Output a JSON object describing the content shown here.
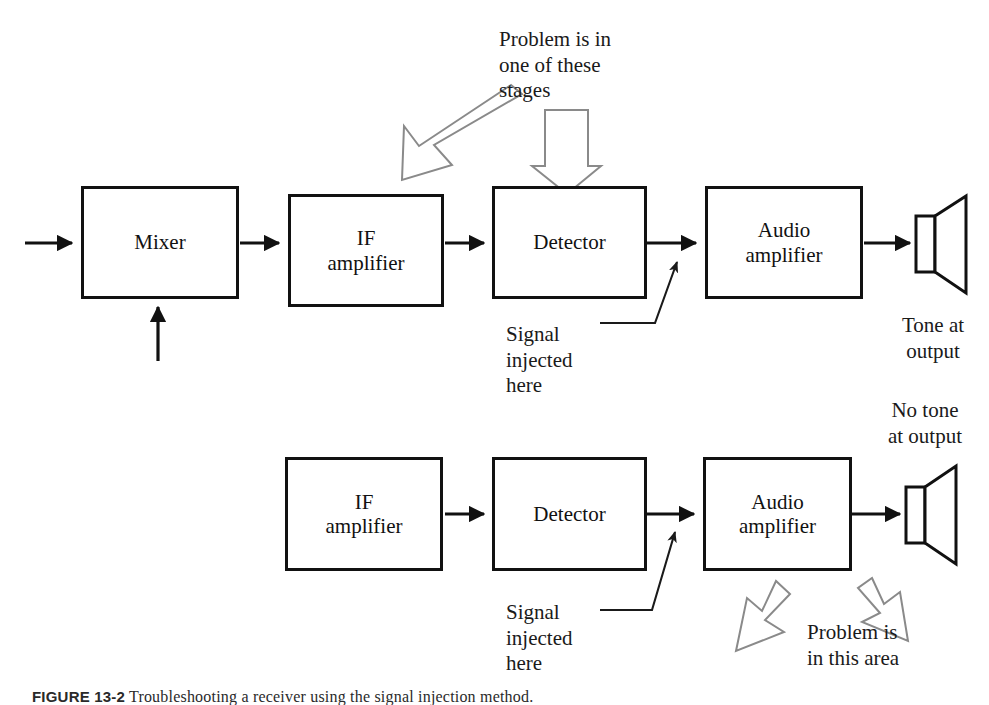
{
  "figure": {
    "caption_label": "FIGURE 13-2",
    "caption_text": "Troubleshooting a receiver using the signal injection method."
  },
  "colors": {
    "line": "#111111",
    "box_border": "#111111",
    "hollow_arrow_stroke": "#7a7a7a",
    "background": "#ffffff",
    "text": "#111111"
  },
  "diagram": {
    "type": "block-diagram",
    "row1": {
      "name": "working-signal-path",
      "blocks": [
        {
          "id": "mixer",
          "label": "Mixer"
        },
        {
          "id": "if-amplifier",
          "label": "IF\namplifier"
        },
        {
          "id": "detector",
          "label": "Detector"
        },
        {
          "id": "audio-amplifier",
          "label": "Audio\namplifier"
        }
      ],
      "output_label": "Tone at\noutput",
      "injection_label": "Signal\ninjected\nhere",
      "top_annotation": "Problem is in\none of these\nstages"
    },
    "row2": {
      "name": "faulty-signal-path",
      "blocks": [
        {
          "id": "if-amplifier-2",
          "label": "IF\namplifier"
        },
        {
          "id": "detector-2",
          "label": "Detector"
        },
        {
          "id": "audio-amplifier-2",
          "label": "Audio\namplifier"
        }
      ],
      "output_label": "No tone\nat output",
      "injection_label": "Signal\ninjected\nhere",
      "problem_annotation": "Problem is\nin this area"
    }
  }
}
